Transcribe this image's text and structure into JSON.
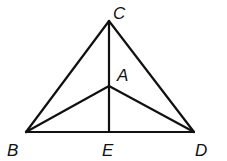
{
  "diagram": {
    "type": "geometry-figure",
    "points": {
      "C": {
        "label": "C",
        "x": 109,
        "y": 21
      },
      "A": {
        "label": "A",
        "x": 109,
        "y": 86
      },
      "B": {
        "label": "B",
        "x": 26,
        "y": 132
      },
      "E": {
        "label": "E",
        "x": 109,
        "y": 132
      },
      "D": {
        "label": "D",
        "x": 194,
        "y": 132
      }
    },
    "segments": [
      "CB",
      "CD",
      "BD",
      "CE",
      "AB",
      "AD"
    ],
    "stroke_color": "#111111"
  }
}
